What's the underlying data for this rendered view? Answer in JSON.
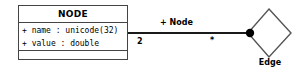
{
  "diagram": {
    "type": "uml-class-diagram",
    "background_color": "#ffffff",
    "stroke_color": "#444444",
    "text_color": "#000000"
  },
  "class_box": {
    "name": "NODE",
    "attributes": [
      "+ name : unicode(32)",
      "+ value : double"
    ],
    "operations": []
  },
  "association": {
    "role_label": "+ Node",
    "source_multiplicity": "2",
    "target_multiplicity": "*",
    "end_marker": "filled-dot"
  },
  "relationship_node": {
    "shape": "diamond",
    "label": "Edge"
  }
}
